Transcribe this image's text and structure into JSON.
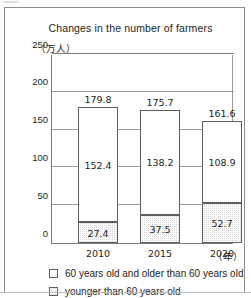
{
  "figure": {
    "title": "Changes in the number of farmers",
    "y_unit": "（万人）",
    "x_unit": "（年）"
  },
  "legend": {
    "items": [
      {
        "swatch": "white-square",
        "label": "60 years old and older than 60 years old"
      },
      {
        "swatch": "stipple-square",
        "label": "younger than 60 years old"
      }
    ]
  },
  "chart_data": {
    "type": "bar",
    "subtype": "stacked",
    "title": "Changes in the number of farmers",
    "xlabel": "（年）",
    "ylabel": "（万人）",
    "ylim": [
      0,
      250
    ],
    "yticks": [
      0,
      50,
      100,
      150,
      200,
      250
    ],
    "ytick_labels": [
      "0",
      "50",
      "100",
      "150",
      "200",
      "250"
    ],
    "grid": true,
    "legend_position": "below",
    "categories": [
      "2010",
      "2015",
      "2020"
    ],
    "totals": [
      179.8,
      175.7,
      161.6
    ],
    "total_labels": [
      "179.8",
      "175.7",
      "161.6"
    ],
    "series": [
      {
        "name": "60 years old and older than 60 years old",
        "values": [
          152.4,
          138.2,
          108.9
        ],
        "labels": [
          "152.4",
          "138.2",
          "108.9"
        ],
        "fill": "white"
      },
      {
        "name": "younger than 60 years old",
        "values": [
          27.4,
          37.5,
          52.7
        ],
        "labels": [
          "27.4",
          "37.5",
          "52.7"
        ],
        "fill": "stipple-gray"
      }
    ]
  }
}
